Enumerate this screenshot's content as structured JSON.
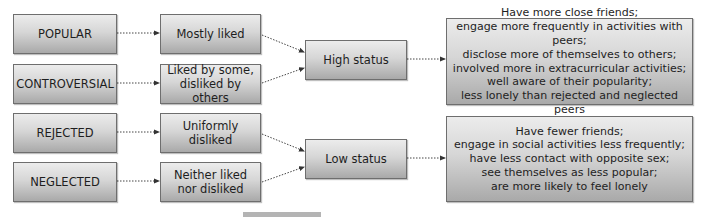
{
  "diagram": {
    "categories": [
      {
        "label": "POPULAR",
        "evaluation": "Mostly liked"
      },
      {
        "label": "CONTROVERSIAL",
        "evaluation_lines": [
          "Liked by some,",
          "disliked by others"
        ]
      },
      {
        "label": "REJECTED",
        "evaluation": "Uniformly disliked"
      },
      {
        "label": "NEGLECTED",
        "evaluation_lines": [
          "Neither liked",
          "nor disliked"
        ]
      }
    ],
    "status": {
      "high": "High status",
      "low": "Low status"
    },
    "outcomes": {
      "high": [
        "Have more close friends;",
        "engage more frequently in activities with peers;",
        "disclose more of themselves to others;",
        "involved more in extracurricular activities;",
        "well aware of their popularity;",
        "less lonely than rejected and neglected peers"
      ],
      "low": [
        "Have fewer friends;",
        "engage in social activities less frequently;",
        "have less contact with opposite sex;",
        "see themselves as less popular;",
        "are more likely to feel lonely"
      ]
    }
  }
}
